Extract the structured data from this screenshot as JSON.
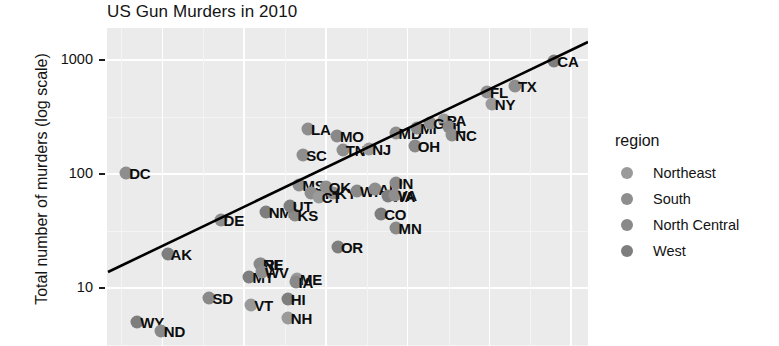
{
  "chart_data": {
    "type": "scatter",
    "title": "US Gun Murders in 2010",
    "xlabel": "",
    "ylabel": "Total number of murders (log scale)",
    "y_scale": "log",
    "y_ticks": [
      10,
      100,
      1000
    ],
    "y_tick_labels": [
      "10",
      "100",
      "1000"
    ],
    "ylim": [
      5,
      2000
    ],
    "grid": true,
    "legend": {
      "title": "region",
      "position": "right",
      "entries": [
        {
          "label": "Northeast",
          "color": "#9a9a9a"
        },
        {
          "label": "South",
          "color": "#8e8e8e"
        },
        {
          "label": "North Central",
          "color": "#898989"
        },
        {
          "label": "West",
          "color": "#7e7e7e"
        }
      ]
    },
    "fit_line": {
      "present": true,
      "color": "#000000",
      "description": "straight regression line rising left to right"
    },
    "points": [
      {
        "label": "DC",
        "region": "South",
        "value": 99,
        "x": 0.04,
        "y": 0.455
      },
      {
        "label": "DE",
        "region": "South",
        "value": 38,
        "x": 0.236,
        "y": 0.605
      },
      {
        "label": "AK",
        "region": "West",
        "value": 19,
        "x": 0.126,
        "y": 0.712
      },
      {
        "label": "RI",
        "region": "Northeast",
        "value": 16,
        "x": 0.32,
        "y": 0.742
      },
      {
        "label": "MT",
        "region": "West",
        "value": 12,
        "x": 0.296,
        "y": 0.783
      },
      {
        "label": "ME",
        "region": "Northeast",
        "value": 11,
        "x": 0.395,
        "y": 0.79
      },
      {
        "label": "SD",
        "region": "North Central",
        "value": 8,
        "x": 0.213,
        "y": 0.85
      },
      {
        "label": "HI",
        "region": "West",
        "value": 7,
        "x": 0.376,
        "y": 0.853
      },
      {
        "label": "WY",
        "region": "West",
        "value": 5,
        "x": 0.063,
        "y": 0.925
      },
      {
        "label": "NH",
        "region": "Northeast",
        "value": 5,
        "x": 0.376,
        "y": 0.912
      },
      {
        "label": "ND",
        "region": "North Central",
        "value": 4,
        "x": 0.112,
        "y": 0.952
      },
      {
        "label": "VT",
        "region": "Northeast",
        "value": 6,
        "x": 0.3,
        "y": 0.87
      },
      {
        "label": "NE",
        "region": "North Central",
        "value": 32,
        "x": 0.318,
        "y": 0.742
      },
      {
        "label": "WV",
        "region": "South",
        "value": 28,
        "x": 0.322,
        "y": 0.768
      },
      {
        "label": "IA",
        "region": "North Central",
        "value": 21,
        "x": 0.392,
        "y": 0.798
      },
      {
        "label": "OR",
        "region": "West",
        "value": 36,
        "x": 0.48,
        "y": 0.69
      },
      {
        "label": "NM",
        "region": "West",
        "value": 67,
        "x": 0.33,
        "y": 0.58
      },
      {
        "label": "KS",
        "region": "North Central",
        "value": 62,
        "x": 0.39,
        "y": 0.588
      },
      {
        "label": "MN",
        "region": "North Central",
        "value": 53,
        "x": 0.6,
        "y": 0.63
      },
      {
        "label": "CO",
        "region": "West",
        "value": 65,
        "x": 0.57,
        "y": 0.585
      },
      {
        "label": "UT",
        "region": "West",
        "value": 44,
        "x": 0.38,
        "y": 0.56
      },
      {
        "label": "MS",
        "region": "South",
        "value": 120,
        "x": 0.4,
        "y": 0.495
      },
      {
        "label": "AR",
        "region": "South",
        "value": 110,
        "x": 0.425,
        "y": 0.52
      },
      {
        "label": "KY",
        "region": "South",
        "value": 130,
        "x": 0.47,
        "y": 0.52
      },
      {
        "label": "OK",
        "region": "South",
        "value": 142,
        "x": 0.455,
        "y": 0.5
      },
      {
        "label": "CT",
        "region": "Northeast",
        "value": 97,
        "x": 0.44,
        "y": 0.53
      },
      {
        "label": "WI",
        "region": "North Central",
        "value": 97,
        "x": 0.52,
        "y": 0.512
      },
      {
        "label": "AL",
        "region": "South",
        "value": 135,
        "x": 0.558,
        "y": 0.505
      },
      {
        "label": "WA",
        "region": "West",
        "value": 95,
        "x": 0.585,
        "y": 0.528
      },
      {
        "label": "IN",
        "region": "North Central",
        "value": 142,
        "x": 0.6,
        "y": 0.487
      },
      {
        "label": "VA",
        "region": "South",
        "value": 250,
        "x": 0.598,
        "y": 0.525
      },
      {
        "label": "SC",
        "region": "South",
        "value": 207,
        "x": 0.408,
        "y": 0.4
      },
      {
        "label": "LA",
        "region": "South",
        "value": 351,
        "x": 0.418,
        "y": 0.318
      },
      {
        "label": "MO",
        "region": "North Central",
        "value": 321,
        "x": 0.478,
        "y": 0.34
      },
      {
        "label": "TN",
        "region": "South",
        "value": 269,
        "x": 0.49,
        "y": 0.385
      },
      {
        "label": "NJ",
        "region": "Northeast",
        "value": 246,
        "x": 0.545,
        "y": 0.38
      },
      {
        "label": "MD",
        "region": "South",
        "value": 293,
        "x": 0.6,
        "y": 0.33
      },
      {
        "label": "OH",
        "region": "North Central",
        "value": 310,
        "x": 0.64,
        "y": 0.37
      },
      {
        "label": "MI",
        "region": "North Central",
        "value": 413,
        "x": 0.645,
        "y": 0.315
      },
      {
        "label": "PA",
        "region": "Northeast",
        "value": 457,
        "x": 0.7,
        "y": 0.29
      },
      {
        "label": "GA",
        "region": "South",
        "value": 376,
        "x": 0.672,
        "y": 0.3
      },
      {
        "label": "IL",
        "region": "North Central",
        "value": 364,
        "x": 0.712,
        "y": 0.31
      },
      {
        "label": "NC",
        "region": "South",
        "value": 286,
        "x": 0.718,
        "y": 0.335
      },
      {
        "label": "NY",
        "region": "Northeast",
        "value": 517,
        "x": 0.8,
        "y": 0.24
      },
      {
        "label": "FL",
        "region": "South",
        "value": 669,
        "x": 0.79,
        "y": 0.2
      },
      {
        "label": "TX",
        "region": "South",
        "value": 805,
        "x": 0.848,
        "y": 0.182
      },
      {
        "label": "CA",
        "region": "West",
        "value": 1257,
        "x": 0.93,
        "y": 0.105
      }
    ]
  }
}
